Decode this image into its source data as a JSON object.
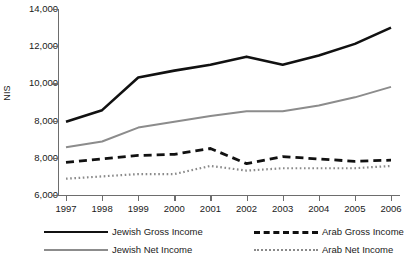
{
  "chart_data": {
    "type": "line",
    "title": "",
    "xlabel": "",
    "ylabel": "NIS",
    "categories": [
      "1997",
      "1998",
      "1999",
      "2000",
      "2001",
      "2002",
      "2003",
      "2004",
      "2005",
      "2006"
    ],
    "x": [
      1997,
      1998,
      1999,
      2000,
      2001,
      2002,
      2003,
      2004,
      2005,
      2006
    ],
    "ytick_labels": [
      "14,000",
      "12,000",
      "10,000",
      "8,000",
      "8,000",
      "6,000"
    ],
    "ytick_values": [
      14000,
      12000,
      10000,
      9000,
      8000,
      6000
    ],
    "ylim": [
      6000,
      14000
    ],
    "grid": false,
    "legend_position": "bottom",
    "series": [
      {
        "name": "Jewish Gross Income",
        "style": "solid",
        "color": "#111111",
        "values": [
          9150,
          9650,
          11050,
          11350,
          11600,
          11950,
          11600,
          12000,
          12500,
          13200
        ]
      },
      {
        "name": "Jewish Net Income",
        "style": "solid",
        "color": "#8c8c8c",
        "values": [
          8050,
          8300,
          8900,
          9150,
          9400,
          9600,
          9600,
          9850,
          10200,
          10650
        ]
      },
      {
        "name": "Arab Gross Income",
        "style": "dashed",
        "color": "#111111",
        "values": [
          7400,
          7550,
          7700,
          7750,
          8000,
          7350,
          7650,
          7550,
          7450,
          7500
        ]
      },
      {
        "name": "Arab Net Income",
        "style": "dotted",
        "color": "#8a8a8a",
        "values": [
          6700,
          6800,
          6900,
          6900,
          7250,
          7050,
          7150,
          7150,
          7150,
          7250
        ]
      }
    ]
  },
  "axis": {
    "y_title": "NIS"
  },
  "legend": {
    "items": [
      {
        "label": "Jewish Gross Income",
        "swatch": "sw-solid-black"
      },
      {
        "label": "Arab Gross Income",
        "swatch": "sw-dash-black"
      },
      {
        "label": "Jewish Net Income",
        "swatch": "sw-solid-gray"
      },
      {
        "label": "Arab Net Income",
        "swatch": "sw-dot-gray"
      }
    ]
  }
}
